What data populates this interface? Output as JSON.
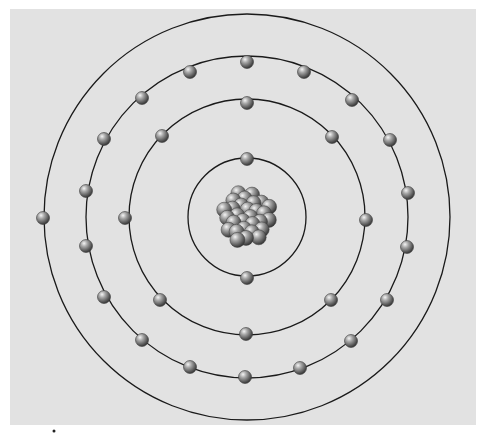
{
  "diagram": {
    "type": "bohr-atom-model",
    "panel": {
      "x": 10,
      "y": 9,
      "width": 466,
      "height": 416,
      "color": "#e2e2e2"
    },
    "center": {
      "x": 247,
      "y": 217
    },
    "orbit_color": "#1a1a1a",
    "electron_radius": 6.5,
    "nucleus": {
      "radius": 33,
      "particle_count": 29,
      "particle_radius": 7.5
    },
    "shells": [
      {
        "name": "shell-1",
        "radius": 59,
        "electron_count": 2,
        "electrons": [
          [
            247,
            159
          ],
          [
            247,
            278
          ]
        ]
      },
      {
        "name": "shell-2",
        "radius": 118,
        "electron_count": 8,
        "electrons": [
          [
            247,
            103
          ],
          [
            162,
            136
          ],
          [
            332,
            137
          ],
          [
            125,
            218
          ],
          [
            366,
            220
          ],
          [
            160,
            300
          ],
          [
            331,
            300
          ],
          [
            246,
            334
          ]
        ]
      },
      {
        "name": "shell-3",
        "radius": 161,
        "electron_count": 18,
        "electrons": [
          [
            247,
            62
          ],
          [
            190,
            72
          ],
          [
            304,
            72
          ],
          [
            142,
            98
          ],
          [
            352,
            100
          ],
          [
            104,
            139
          ],
          [
            390,
            140
          ],
          [
            86,
            191
          ],
          [
            408,
            193
          ],
          [
            86,
            246
          ],
          [
            407,
            247
          ],
          [
            104,
            297
          ],
          [
            387,
            300
          ],
          [
            142,
            340
          ],
          [
            351,
            341
          ],
          [
            190,
            367
          ],
          [
            300,
            368
          ],
          [
            245,
            377
          ]
        ]
      },
      {
        "name": "shell-4",
        "radius": 203,
        "electron_count": 1,
        "electrons": [
          [
            43,
            218
          ]
        ]
      }
    ],
    "total_electrons": 29
  }
}
